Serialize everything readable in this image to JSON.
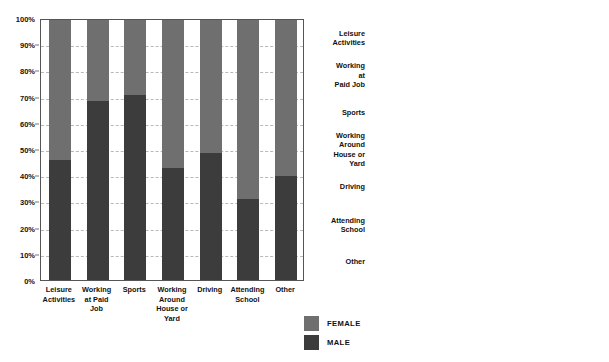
{
  "legend": {
    "items": [
      {
        "label": "FEMALE",
        "color": "#6f6f6f",
        "name": "female"
      },
      {
        "label": "MALE",
        "color": "#3c3c3c",
        "name": "male"
      }
    ]
  },
  "chart_data": [
    {
      "type": "bar",
      "id": "percent-distribution",
      "orientation": "vertical",
      "stacked": true,
      "stack_mode": "percent",
      "title": "",
      "xlabel": "",
      "ylabel": "",
      "ylim": [
        0,
        100
      ],
      "yticks": [
        "0%",
        "10%",
        "20%",
        "30%",
        "40%",
        "50%",
        "60%",
        "70%",
        "80%",
        "90%",
        "100%"
      ],
      "ytick_values": [
        0,
        10,
        20,
        30,
        40,
        50,
        60,
        70,
        80,
        90,
        100
      ],
      "grid": true,
      "legend_position": "bottom-center",
      "categories": [
        "Leisure Activities",
        "Working at Paid Job",
        "Sports",
        "Working Around House or Yard",
        "Driving",
        "Attending School",
        "Other"
      ],
      "category_lines": [
        [
          "Leisure",
          "Activities"
        ],
        [
          "Working",
          "at Paid",
          "Job"
        ],
        [
          "Sports"
        ],
        [
          "Working",
          "Around",
          "House or",
          "Yard"
        ],
        [
          "Driving"
        ],
        [
          "Attending",
          "School"
        ],
        [
          "Other"
        ]
      ],
      "series": [
        {
          "name": "MALE",
          "color": "#3c3c3c",
          "values": [
            46,
            69,
            71,
            43,
            49,
            31,
            40
          ]
        },
        {
          "name": "FEMALE",
          "color": "#6f6f6f",
          "values": [
            54,
            31,
            29,
            57,
            51,
            69,
            60
          ]
        }
      ]
    },
    {
      "type": "bar",
      "id": "episodes-rate",
      "orientation": "horizontal",
      "stacked": false,
      "title": "",
      "xlabel": "Episodes per 1,000 Population",
      "ylabel": "",
      "xlim": [
        0,
        35
      ],
      "xticks": [
        "0",
        "5",
        "10",
        "15",
        "20",
        "25",
        "30",
        "35"
      ],
      "xtick_values": [
        0,
        5,
        10,
        15,
        20,
        25,
        30,
        35
      ],
      "grid": true,
      "legend_position": "bottom-left",
      "categories": [
        "Leisure Activities",
        "Working at Paid Job",
        "Sports",
        "Working Around House or Yard",
        "Driving",
        "Attending School",
        "Other"
      ],
      "category_lines": [
        [
          "Leisure",
          "Activities"
        ],
        [
          "Working",
          "at",
          "Paid Job"
        ],
        [
          "Sports"
        ],
        [
          "Working",
          "Around",
          "House or",
          "Yard"
        ],
        [
          "Driving"
        ],
        [
          "Attending",
          "School"
        ],
        [
          "Other"
        ]
      ],
      "series": [
        {
          "name": "FEMALE",
          "color": "#6f6f6f",
          "values": [
            32.3,
            10.8,
            10.2,
            17.5,
            8.8,
            5.0,
            20.5
          ]
        },
        {
          "name": "MALE",
          "color": "#3c3c3c",
          "values": [
            29.2,
            25.5,
            24.7,
            14.5,
            8.3,
            2.0,
            15.2
          ]
        }
      ]
    }
  ]
}
